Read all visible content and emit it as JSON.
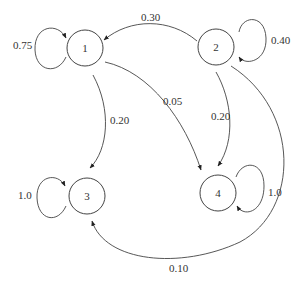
{
  "diagram": {
    "nodes": [
      {
        "id": "1",
        "label": "1"
      },
      {
        "id": "2",
        "label": "2"
      },
      {
        "id": "3",
        "label": "3"
      },
      {
        "id": "4",
        "label": "4"
      }
    ],
    "edges": [
      {
        "from": "1",
        "to": "1",
        "label": "0.75"
      },
      {
        "from": "2",
        "to": "1",
        "label": "0.30"
      },
      {
        "from": "2",
        "to": "2",
        "label": "0.40"
      },
      {
        "from": "1",
        "to": "3",
        "label": "0.20"
      },
      {
        "from": "1",
        "to": "4",
        "label": "0.05"
      },
      {
        "from": "2",
        "to": "4",
        "label": "0.20"
      },
      {
        "from": "2",
        "to": "3",
        "label": "0.10"
      },
      {
        "from": "3",
        "to": "3",
        "label": "1.0"
      },
      {
        "from": "4",
        "to": "4",
        "label": "1.0"
      }
    ],
    "colors": {
      "stroke": "#444444",
      "text": "#333333",
      "background": "#ffffff"
    }
  }
}
